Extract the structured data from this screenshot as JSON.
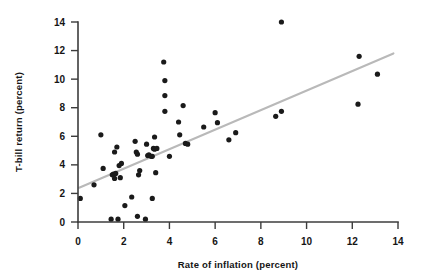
{
  "chart_data": {
    "type": "scatter",
    "title": "",
    "xlabel": "Rate of inflation (percent)",
    "ylabel": "T-bill return (percent)",
    "xlim": [
      0,
      14
    ],
    "ylim": [
      0,
      14
    ],
    "xticks": [
      0,
      2,
      4,
      6,
      8,
      10,
      12,
      14
    ],
    "yticks": [
      0,
      2,
      4,
      6,
      8,
      10,
      12,
      14
    ],
    "xtick_labels": [
      "0",
      "2",
      "4",
      "6",
      "8",
      "10",
      "12",
      "14"
    ],
    "ytick_labels": [
      "0",
      "2",
      "4",
      "6",
      "8",
      "10",
      "12",
      "14"
    ],
    "grid": false,
    "legend": null,
    "point_color": "#1a1a1a",
    "point_size": 2.6,
    "series": [
      {
        "name": "Annual observations",
        "marker": "circle",
        "points": [
          [
            0.1,
            1.65
          ],
          [
            0.7,
            2.6
          ],
          [
            1.0,
            6.1
          ],
          [
            1.1,
            3.75
          ],
          [
            1.45,
            0.2
          ],
          [
            1.5,
            3.3
          ],
          [
            1.55,
            3.35
          ],
          [
            1.6,
            4.9
          ],
          [
            1.6,
            3.05
          ],
          [
            1.65,
            3.4
          ],
          [
            1.7,
            5.25
          ],
          [
            1.75,
            0.2
          ],
          [
            1.8,
            3.95
          ],
          [
            1.85,
            3.1
          ],
          [
            1.9,
            4.1
          ],
          [
            2.05,
            1.15
          ],
          [
            2.35,
            1.75
          ],
          [
            2.5,
            5.65
          ],
          [
            2.55,
            4.9
          ],
          [
            2.6,
            4.75
          ],
          [
            2.6,
            0.4
          ],
          [
            2.65,
            3.3
          ],
          [
            2.7,
            3.6
          ],
          [
            2.95,
            0.2
          ],
          [
            3.0,
            5.45
          ],
          [
            3.05,
            4.65
          ],
          [
            3.1,
            4.7
          ],
          [
            3.2,
            4.6
          ],
          [
            3.25,
            4.6
          ],
          [
            3.25,
            1.65
          ],
          [
            3.3,
            5.15
          ],
          [
            3.35,
            5.1
          ],
          [
            3.35,
            5.95
          ],
          [
            3.4,
            3.45
          ],
          [
            3.45,
            5.15
          ],
          [
            3.75,
            11.2
          ],
          [
            3.8,
            9.9
          ],
          [
            3.8,
            8.85
          ],
          [
            3.8,
            7.75
          ],
          [
            4.0,
            4.6
          ],
          [
            4.4,
            7.0
          ],
          [
            4.45,
            6.1
          ],
          [
            4.6,
            8.15
          ],
          [
            4.7,
            5.5
          ],
          [
            4.8,
            5.45
          ],
          [
            5.5,
            6.65
          ],
          [
            6.0,
            7.65
          ],
          [
            6.1,
            6.95
          ],
          [
            6.6,
            5.75
          ],
          [
            6.9,
            6.25
          ],
          [
            8.65,
            7.4
          ],
          [
            8.9,
            7.75
          ],
          [
            8.9,
            14.0
          ],
          [
            12.25,
            8.25
          ],
          [
            12.3,
            11.6
          ],
          [
            13.1,
            10.35
          ]
        ]
      }
    ],
    "fit_line": {
      "name": "regression line",
      "color": "#b9b9b9",
      "x_start": 0.05,
      "y_start": 2.4,
      "x_end": 13.8,
      "y_end": 11.8
    }
  }
}
